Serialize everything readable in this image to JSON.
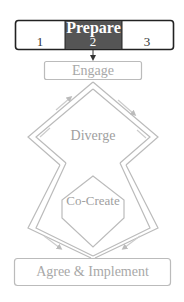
{
  "stage_bar": {
    "title": "Prepare",
    "steps": [
      "1",
      "2",
      "3"
    ],
    "active_step": "2",
    "colors": {
      "active_fill": "#555555",
      "border": "#222222",
      "active_text": "#ffffff",
      "text": "#333333"
    }
  },
  "phases": {
    "engage": "Engage",
    "diverge": "Diverge",
    "co_create": "Co-Create",
    "agree_implement": "Agree & Implement"
  },
  "colors": {
    "phase_line": "#b8b8b8",
    "phase_text": "#a0a0a0"
  }
}
